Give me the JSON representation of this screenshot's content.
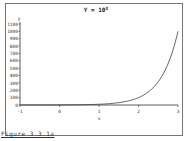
{
  "chart_data": {
    "type": "line",
    "title_base": "Y = 10",
    "title_exp": "X",
    "xlabel": "x",
    "ylabel": "y",
    "xlim": [
      -1,
      3
    ],
    "ylim": [
      0,
      1100
    ],
    "xticks": [
      -1,
      0,
      1,
      2,
      3
    ],
    "yticks": [
      0,
      100,
      200,
      300,
      400,
      500,
      600,
      700,
      800,
      900,
      1000,
      1100
    ],
    "grid": false,
    "series": [
      {
        "name": "y = 10^x",
        "function": "10^x",
        "x": [
          -1,
          -0.5,
          0,
          0.5,
          1,
          1.25,
          1.5,
          1.75,
          2,
          2.25,
          2.5,
          2.75,
          3
        ],
        "y": [
          0.1,
          0.316,
          1,
          3.16,
          10,
          17.8,
          31.6,
          56.2,
          100,
          177.8,
          316.2,
          562.3,
          1000
        ]
      }
    ]
  },
  "caption": "Figure 3.3.1a"
}
